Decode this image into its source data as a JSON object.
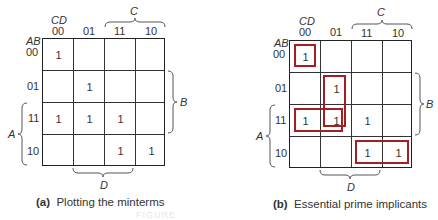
{
  "figure": {
    "faint_footer": "FIGURE"
  },
  "axes": {
    "col_var": "CD",
    "row_var": "AB",
    "col_labels": [
      "00",
      "01",
      "11",
      "10"
    ],
    "row_labels": [
      "00",
      "01",
      "11",
      "10"
    ],
    "brace_C": "C",
    "brace_D": "D",
    "brace_A": "A",
    "brace_B": "B"
  },
  "panels": [
    {
      "id": "a",
      "caption_tag": "(a)",
      "caption_text": "Plotting the minterms",
      "cells": [
        [
          "1",
          "",
          "",
          ""
        ],
        [
          "",
          "1",
          "",
          ""
        ],
        [
          "1",
          "1",
          "1",
          ""
        ],
        [
          "",
          "",
          "1",
          "1"
        ]
      ]
    },
    {
      "id": "b",
      "caption_tag": "(b)",
      "caption_text": "Essential prime implicants",
      "cells": [
        [
          "1",
          "",
          "",
          ""
        ],
        [
          "",
          "1",
          "",
          ""
        ],
        [
          "1",
          "1",
          "1",
          ""
        ],
        [
          "",
          "",
          "1",
          "1"
        ]
      ],
      "loops": [
        {
          "name": "loop-m0",
          "cells": "row00-col00"
        },
        {
          "name": "loop-col01-rows01-11",
          "cells": "rows01,11-col01"
        },
        {
          "name": "loop-row11-cols00-01",
          "cells": "row11-cols00,01"
        },
        {
          "name": "loop-row10-cols11-10",
          "cells": "row10-cols11,10"
        }
      ],
      "loop_color": "#a31f24"
    }
  ]
}
